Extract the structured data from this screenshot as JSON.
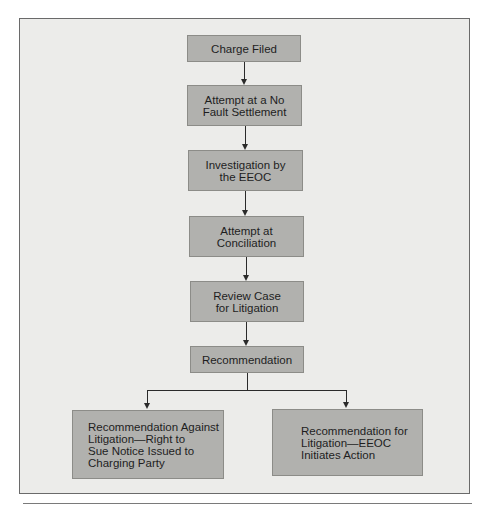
{
  "diagram": {
    "type": "flowchart",
    "nodes": [
      {
        "id": "charge_filed",
        "label": "Charge Filed"
      },
      {
        "id": "no_fault",
        "label": "Attempt at a No\nFault Settlement"
      },
      {
        "id": "investigation",
        "label": "Investigation by\nthe EEOC"
      },
      {
        "id": "conciliation",
        "label": "Attempt at\nConciliation"
      },
      {
        "id": "review",
        "label": "Review Case\nfor Litigation"
      },
      {
        "id": "recommendation",
        "label": "Recommendation"
      },
      {
        "id": "against",
        "label": "Recommendation Against\nLitigation—Right to\nSue Notice Issued to\nCharging Party"
      },
      {
        "id": "for",
        "label": "Recommendation for\nLitigation—EEOC\nInitiates Action"
      }
    ],
    "edges": [
      [
        "charge_filed",
        "no_fault"
      ],
      [
        "no_fault",
        "investigation"
      ],
      [
        "investigation",
        "conciliation"
      ],
      [
        "conciliation",
        "review"
      ],
      [
        "review",
        "recommendation"
      ],
      [
        "recommendation",
        "against"
      ],
      [
        "recommendation",
        "for"
      ]
    ]
  },
  "colors": {
    "frame_bg": "#ececea",
    "box_fill": "#b1b1ae",
    "line": "#2a2a2a"
  }
}
